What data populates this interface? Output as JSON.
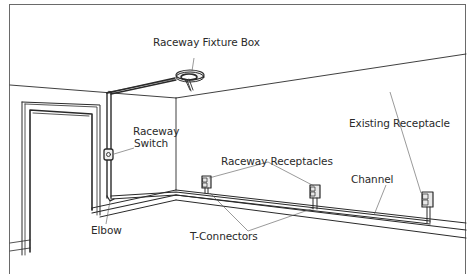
{
  "figure": {
    "labels": {
      "fixture_box": "Raceway Fixture Box",
      "switch_line1": "Raceway",
      "switch_line2": "Switch",
      "elbow": "Elbow",
      "receptacles": "Raceway Receptacles",
      "t_connectors": "T-Connectors",
      "channel": "Channel",
      "existing_receptacle": "Existing Receptacle"
    },
    "caption_truncated": "(caption text cut off at bottom edge)"
  }
}
